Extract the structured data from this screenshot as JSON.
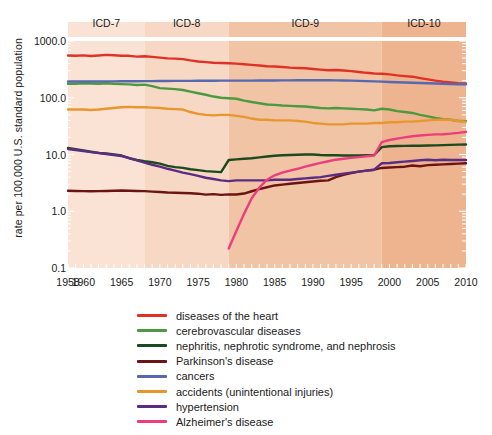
{
  "chart_data": {
    "type": "line",
    "title": "",
    "xlabel": "",
    "ylabel": "rate per 100,000 U.S. standard population",
    "yscale": "log",
    "ylim": [
      0.1,
      1000.0
    ],
    "xlim": [
      1958,
      2010
    ],
    "grid": false,
    "legend_position": "below",
    "ytick_labels": [
      "1000.0",
      "100.0",
      "10.0",
      "1.0",
      "0.1"
    ],
    "ytick_values": [
      1000.0,
      100.0,
      10.0,
      1.0,
      0.1
    ],
    "xtick_labels": [
      "1958",
      "1960",
      "1965",
      "1970",
      "1975",
      "1980",
      "1985",
      "1990",
      "1995",
      "2000",
      "2005",
      "2010"
    ],
    "xtick_values": [
      1958,
      1960,
      1965,
      1970,
      1975,
      1980,
      1985,
      1990,
      1995,
      2000,
      2005,
      2010
    ],
    "bands": [
      {
        "label": "ICD-7",
        "start": 1958,
        "end": 1968,
        "color": "#fae2d4"
      },
      {
        "label": "ICD-8",
        "start": 1968,
        "end": 1979,
        "color": "#f7d8c4"
      },
      {
        "label": "ICD-9",
        "start": 1979,
        "end": 1999,
        "color": "#f2c4a6"
      },
      {
        "label": "ICD-10",
        "start": 1999,
        "end": 2010,
        "color": "#edb48f"
      }
    ],
    "x": [
      1958,
      1959,
      1960,
      1961,
      1962,
      1963,
      1964,
      1965,
      1966,
      1967,
      1968,
      1969,
      1970,
      1971,
      1972,
      1973,
      1974,
      1975,
      1976,
      1977,
      1978,
      1979,
      1980,
      1981,
      1982,
      1983,
      1984,
      1985,
      1986,
      1987,
      1988,
      1989,
      1990,
      1991,
      1992,
      1993,
      1994,
      1995,
      1996,
      1997,
      1998,
      1999,
      2000,
      2001,
      2002,
      2003,
      2004,
      2005,
      2006,
      2007,
      2008,
      2009,
      2010
    ],
    "series": [
      {
        "name": "diseases of the heart",
        "color": "#e03127",
        "values": [
          555,
          550,
          559,
          545,
          556,
          570,
          560,
          550,
          548,
          530,
          540,
          525,
          510,
          495,
          490,
          480,
          455,
          435,
          425,
          415,
          410,
          405,
          400,
          390,
          380,
          370,
          360,
          355,
          348,
          340,
          335,
          330,
          322,
          313,
          305,
          308,
          302,
          294,
          285,
          275,
          268,
          265,
          258,
          248,
          241,
          235,
          222,
          211,
          200,
          191,
          186,
          180,
          179
        ]
      },
      {
        "name": "cerebrovascular diseases",
        "color": "#4c9a3f",
        "values": [
          177,
          176,
          180,
          178,
          177,
          180,
          176,
          174,
          172,
          168,
          170,
          160,
          148,
          145,
          142,
          137,
          128,
          120,
          113,
          105,
          100,
          98,
          96,
          89,
          84,
          80,
          76,
          75,
          73,
          72,
          71,
          70,
          68,
          66,
          65,
          66,
          65,
          64,
          63,
          62,
          60,
          64,
          62,
          58,
          56,
          54,
          50,
          47,
          44,
          42,
          41,
          39,
          39
        ]
      },
      {
        "name": "nephritis, nephrotic syndrome, and nephrosis",
        "color": "#1c4a1e",
        "values": [
          13.0,
          12.4,
          11.8,
          11.2,
          10.7,
          10.4,
          10.0,
          9.6,
          8.6,
          8.0,
          7.6,
          7.3,
          6.9,
          6.3,
          6.0,
          5.8,
          5.5,
          5.3,
          5.1,
          5.0,
          4.9,
          8.0,
          8.2,
          8.4,
          8.6,
          8.9,
          9.2,
          9.5,
          9.7,
          9.8,
          9.9,
          10.0,
          10.0,
          9.8,
          9.7,
          9.7,
          9.6,
          9.6,
          9.6,
          9.7,
          9.8,
          13.5,
          14.0,
          14.1,
          14.2,
          14.3,
          14.3,
          14.4,
          14.5,
          14.6,
          14.8,
          14.9,
          15.0
        ]
      },
      {
        "name": "Parkinson's disease",
        "color": "#6b1414",
        "values": [
          2.3,
          2.28,
          2.26,
          2.25,
          2.26,
          2.28,
          2.3,
          2.32,
          2.3,
          2.28,
          2.26,
          2.22,
          2.18,
          2.14,
          2.12,
          2.1,
          2.08,
          2.04,
          1.96,
          2.0,
          1.94,
          1.98,
          1.97,
          2.05,
          2.25,
          2.45,
          2.65,
          2.85,
          2.95,
          3.05,
          3.15,
          3.25,
          3.35,
          3.45,
          3.5,
          4.0,
          4.4,
          4.7,
          5.0,
          5.2,
          5.4,
          5.8,
          5.9,
          6.0,
          6.1,
          6.4,
          6.2,
          6.5,
          6.6,
          6.7,
          6.8,
          6.9,
          7.0
        ]
      },
      {
        "name": "cancers",
        "color": "#5568b0",
        "values": [
          193,
          193,
          193,
          193,
          193,
          194,
          194,
          195,
          195,
          195,
          196,
          196,
          197,
          197,
          198,
          198,
          198,
          199,
          199,
          199,
          200,
          200,
          200,
          200,
          200,
          201,
          201,
          201,
          202,
          202,
          203,
          203,
          203,
          203,
          203,
          202,
          201,
          200,
          198,
          196,
          194,
          192,
          190,
          188,
          186,
          184,
          182,
          180,
          178,
          176,
          174,
          173,
          173
        ]
      },
      {
        "name": "accidents (unintentional injuries)",
        "color": "#e8962e",
        "values": [
          62,
          62,
          62,
          61,
          62,
          64,
          66,
          68,
          69,
          68,
          68,
          67,
          66,
          64,
          63,
          62,
          56,
          52,
          50,
          49,
          50,
          50,
          48,
          46,
          43,
          41,
          41,
          40,
          40,
          40,
          39,
          38,
          36,
          35,
          34,
          34,
          34,
          35,
          35,
          35,
          36,
          36,
          37,
          37,
          38,
          38,
          39,
          40,
          41,
          41,
          41,
          39,
          38
        ]
      },
      {
        "name": "hypertension",
        "color": "#5b2d82",
        "values": [
          12.5,
          12.0,
          11.5,
          11.0,
          10.6,
          10.2,
          9.8,
          9.4,
          8.6,
          7.9,
          7.2,
          6.6,
          6.1,
          5.6,
          5.2,
          4.8,
          4.5,
          4.2,
          3.9,
          3.7,
          3.5,
          3.4,
          3.5,
          3.5,
          3.5,
          3.5,
          3.5,
          3.6,
          3.6,
          3.6,
          3.7,
          3.8,
          3.9,
          4.0,
          4.2,
          4.4,
          4.6,
          4.8,
          5.0,
          5.2,
          5.4,
          7.0,
          7.1,
          7.3,
          7.5,
          7.7,
          7.9,
          8.1,
          7.9,
          8.1,
          8.0,
          8.0,
          8.0
        ]
      },
      {
        "name": "Alzheimer's disease",
        "color": "#ec3d7d",
        "values": [
          null,
          null,
          null,
          null,
          null,
          null,
          null,
          null,
          null,
          null,
          null,
          null,
          null,
          null,
          null,
          null,
          null,
          null,
          null,
          null,
          null,
          0.22,
          0.45,
          0.9,
          1.7,
          2.6,
          3.6,
          4.3,
          4.8,
          5.2,
          5.6,
          6.1,
          6.6,
          7.1,
          7.6,
          8.1,
          8.4,
          8.7,
          9.0,
          9.3,
          9.6,
          16.5,
          18.0,
          19.0,
          20.0,
          21.0,
          21.6,
          22.2,
          22.6,
          22.8,
          23.3,
          24.0,
          25.1
        ]
      }
    ]
  },
  "legend": {
    "items": [
      {
        "label": "diseases of the heart",
        "color": "#e03127"
      },
      {
        "label": "cerebrovascular diseases",
        "color": "#4c9a3f"
      },
      {
        "label": "nephritis, nephrotic syndrome, and nephrosis",
        "color": "#1c4a1e"
      },
      {
        "label": "Parkinson's disease",
        "color": "#6b1414"
      },
      {
        "label": "cancers",
        "color": "#5568b0"
      },
      {
        "label": "accidents (unintentional injuries)",
        "color": "#e8962e"
      },
      {
        "label": "hypertension",
        "color": "#5b2d82"
      },
      {
        "label": "Alzheimer's disease",
        "color": "#ec3d7d"
      }
    ]
  }
}
